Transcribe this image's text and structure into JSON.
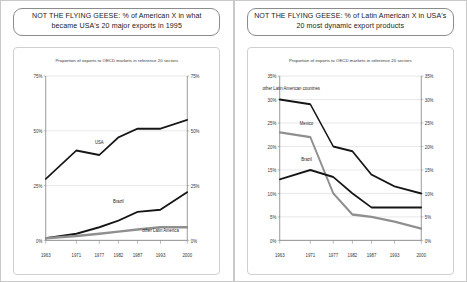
{
  "panels": [
    {
      "title": "NOT THE FLYING GEESE: % of American X in what became USA's 20 major exports in 1995",
      "chart_data": {
        "type": "line",
        "title": "",
        "subtitle": "Proportion of exports to OECD markets in reference 20 sectors",
        "xlabel": "",
        "ylabel": "",
        "x": [
          1963,
          1971,
          1977,
          1982,
          1987,
          1993,
          2000
        ],
        "xticklabels": [
          "1963",
          "1971",
          "1977",
          "1982",
          "1987",
          "1993",
          "2000"
        ],
        "ylim": [
          0,
          75
        ],
        "yticks": [
          0,
          25,
          50,
          75
        ],
        "yticklabels": [
          "0%",
          "25%",
          "50%",
          "75%"
        ],
        "right_axis": true,
        "right_yticklabels": [
          "0%",
          "25%",
          "50%",
          "75%"
        ],
        "grid": true,
        "legend": "inline-labels",
        "series": [
          {
            "name": "USA",
            "color": "#161616",
            "values": [
              28,
              41,
              39,
              47,
              51,
              51,
              55
            ],
            "label_x": 1977,
            "label_y": 44
          },
          {
            "name": "Brazil",
            "color": "#161616",
            "values": [
              1,
              3,
              6,
              9,
              13,
              14,
              22
            ],
            "label_x": 1982,
            "label_y": 17
          },
          {
            "name": "other Latin America",
            "color": "#8f8f8f",
            "values": [
              1,
              2,
              3,
              4,
              5,
              6,
              6
            ],
            "label_x": 1993,
            "label_y": 4
          }
        ]
      }
    },
    {
      "title": "NOT THE FLYING GEESE: % of Latin American X in USA's 20 most dynamic export products",
      "chart_data": {
        "type": "line",
        "title": "",
        "subtitle": "Proportion of exports to OECD markets in reference 20 sectors",
        "xlabel": "",
        "ylabel": "",
        "x": [
          1963,
          1971,
          1977,
          1982,
          1987,
          1993,
          2000
        ],
        "xticklabels": [
          "1963",
          "1971",
          "1977",
          "1982",
          "1987",
          "1993",
          "2000"
        ],
        "ylim": [
          0,
          35
        ],
        "yticks": [
          0,
          5,
          10,
          15,
          20,
          25,
          30,
          35
        ],
        "yticklabels": [
          "0%",
          "5%",
          "10%",
          "15%",
          "20%",
          "25%",
          "30%",
          "35%"
        ],
        "right_axis": true,
        "right_yticklabels": [
          "0%",
          "5%",
          "10%",
          "15%",
          "20%",
          "25%",
          "30%",
          "35%"
        ],
        "grid": true,
        "legend": "inline-labels",
        "series": [
          {
            "name": "other Latin American countries",
            "color": "#161616",
            "values": [
              30,
              29,
              20,
              19,
              14,
              11.5,
              10
            ],
            "label_x": 1966,
            "label_y": 32
          },
          {
            "name": "Mexico",
            "color": "#8f8f8f",
            "values": [
              23,
              22,
              10,
              5.5,
              5,
              4,
              2.5
            ],
            "label_x": 1970,
            "label_y": 24.5
          },
          {
            "name": "Brazil",
            "color": "#161616",
            "values": [
              13,
              15,
              13.5,
              10,
              7,
              7,
              7
            ],
            "label_x": 1970,
            "label_y": 17
          }
        ]
      }
    }
  ]
}
